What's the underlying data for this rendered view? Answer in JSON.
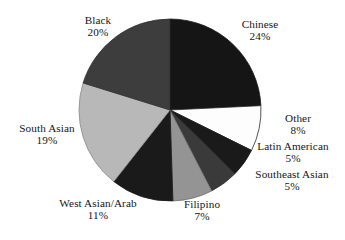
{
  "chart_data": {
    "type": "pie",
    "title": "",
    "subtitle": "",
    "xlabel": "",
    "ylabel": "",
    "legend_position": "none",
    "grid": false,
    "labels_outside": true,
    "start_angle_deg": 0,
    "direction": "clockwise",
    "categories": [
      "Chinese",
      "Other",
      "Latin American",
      "Southeast Asian",
      "Filipino",
      "West Asian/Arab",
      "South Asian",
      "Black"
    ],
    "values": [
      24,
      8,
      5,
      5,
      7,
      11,
      19,
      20
    ],
    "value_unit": "%",
    "slices": [
      {
        "label": "Chinese",
        "value": 24,
        "pct_text": "24%",
        "color": "#151515",
        "stroke": "#151515"
      },
      {
        "label": "Other",
        "value": 8,
        "pct_text": "8%",
        "color": "#fdfdfd",
        "stroke": "#2a2a2a"
      },
      {
        "label": "Latin American",
        "value": 5,
        "pct_text": "5%",
        "color": "#1a1a1a",
        "stroke": "#1a1a1a"
      },
      {
        "label": "Southeast Asian",
        "value": 5,
        "pct_text": "5%",
        "color": "#3a3a3a",
        "stroke": "#2b2b2b"
      },
      {
        "label": "Filipino",
        "value": 7,
        "pct_text": "7%",
        "color": "#949494",
        "stroke": "#6f6f6f"
      },
      {
        "label": "West Asian/Arab",
        "value": 11,
        "pct_text": "11%",
        "color": "#1a1a1a",
        "stroke": "#1a1a1a"
      },
      {
        "label": "South Asian",
        "value": 19,
        "pct_text": "19%",
        "color": "#b8b8b8",
        "stroke": "#8a8a8a"
      },
      {
        "label": "Black",
        "value": 20,
        "pct_text": "20%",
        "color": "#3d3d3d",
        "stroke": "#2e2e2e"
      }
    ],
    "geometry": {
      "cx": 170,
      "cy": 110,
      "r": 91
    }
  },
  "labels": {
    "black": {
      "name": "Black",
      "pct": "20%"
    },
    "chinese": {
      "name": "Chinese",
      "pct": "24%"
    },
    "other": {
      "name": "Other",
      "pct": "8%"
    },
    "latin_american": {
      "name": "Latin American",
      "pct": "5%"
    },
    "southeast_asian": {
      "name": "Southeast Asian",
      "pct": "5%"
    },
    "filipino": {
      "name": "Filipino",
      "pct": "7%"
    },
    "west_asian_arab": {
      "name": "West Asian/Arab",
      "pct": "11%"
    },
    "south_asian": {
      "name": "South Asian",
      "pct": "19%"
    }
  }
}
